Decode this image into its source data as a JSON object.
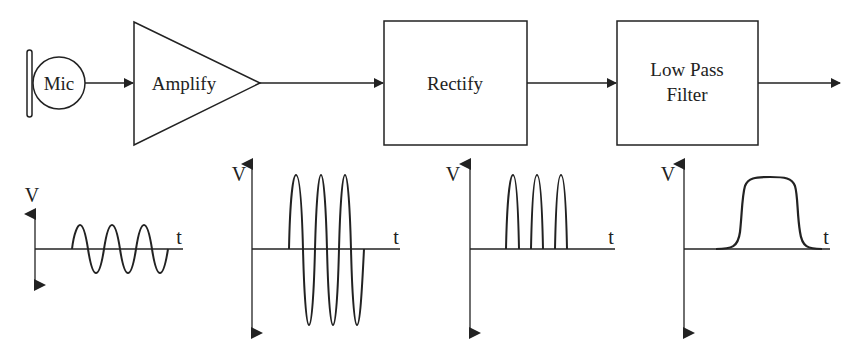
{
  "diagram": {
    "type": "signal-chain block diagram",
    "blocks": [
      {
        "id": "mic",
        "label": "Mic",
        "shape": "circle"
      },
      {
        "id": "amplify",
        "label": "Amplify",
        "shape": "triangle"
      },
      {
        "id": "rectify",
        "label": "Rectify",
        "shape": "rectangle"
      },
      {
        "id": "lpf",
        "label_line1": "Low Pass",
        "label_line2": "Filter",
        "shape": "rectangle"
      }
    ],
    "connections": [
      {
        "from": "mic",
        "to": "amplify"
      },
      {
        "from": "amplify",
        "to": "rectify"
      },
      {
        "from": "rectify",
        "to": "lpf"
      },
      {
        "from": "lpf",
        "to": "output"
      }
    ],
    "waveforms": [
      {
        "id": "mic-output",
        "description": "small sine wave, 3 cycles",
        "y_label": "V",
        "x_label": "t"
      },
      {
        "id": "amplified",
        "description": "large sine wave, 3 cycles",
        "y_label": "V",
        "x_label": "t"
      },
      {
        "id": "rectified",
        "description": "positive half-wave pulses, 3 humps",
        "y_label": "V",
        "x_label": "t"
      },
      {
        "id": "filtered",
        "description": "smooth envelope pulse",
        "y_label": "V",
        "x_label": "t"
      }
    ]
  },
  "colors": {
    "line": "#222222",
    "background": "#ffffff"
  }
}
